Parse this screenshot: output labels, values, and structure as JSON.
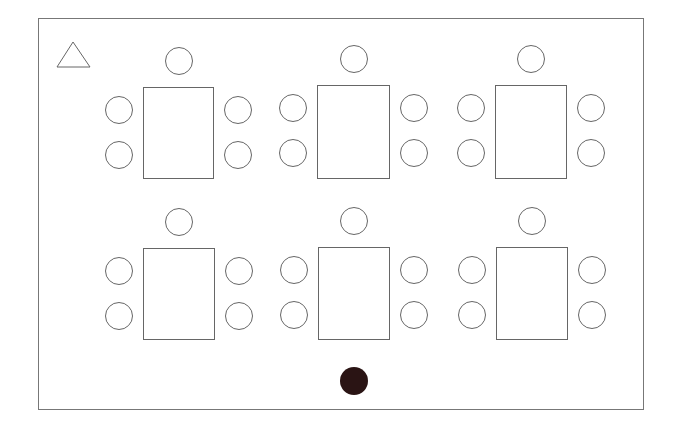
{
  "diagram": {
    "type": "classroom-seating-layout",
    "room": {
      "border_color": "#777777"
    },
    "marker_triangle": {
      "shape": "triangle-icon"
    },
    "marker_dot": {
      "shape": "filled-circle",
      "color": "#2a1414"
    },
    "tables": [
      {
        "row": 1,
        "col": 1,
        "x": 143,
        "y": 87,
        "w": 71,
        "h": 92,
        "chairs": 5
      },
      {
        "row": 1,
        "col": 2,
        "x": 317,
        "y": 85,
        "w": 73,
        "h": 94,
        "chairs": 5
      },
      {
        "row": 1,
        "col": 3,
        "x": 495,
        "y": 85,
        "w": 72,
        "h": 94,
        "chairs": 5
      },
      {
        "row": 2,
        "col": 1,
        "x": 143,
        "y": 248,
        "w": 72,
        "h": 92,
        "chairs": 5
      },
      {
        "row": 2,
        "col": 2,
        "x": 318,
        "y": 247,
        "w": 72,
        "h": 93,
        "chairs": 5
      },
      {
        "row": 2,
        "col": 3,
        "x": 496,
        "y": 247,
        "w": 72,
        "h": 93,
        "chairs": 5
      }
    ]
  }
}
